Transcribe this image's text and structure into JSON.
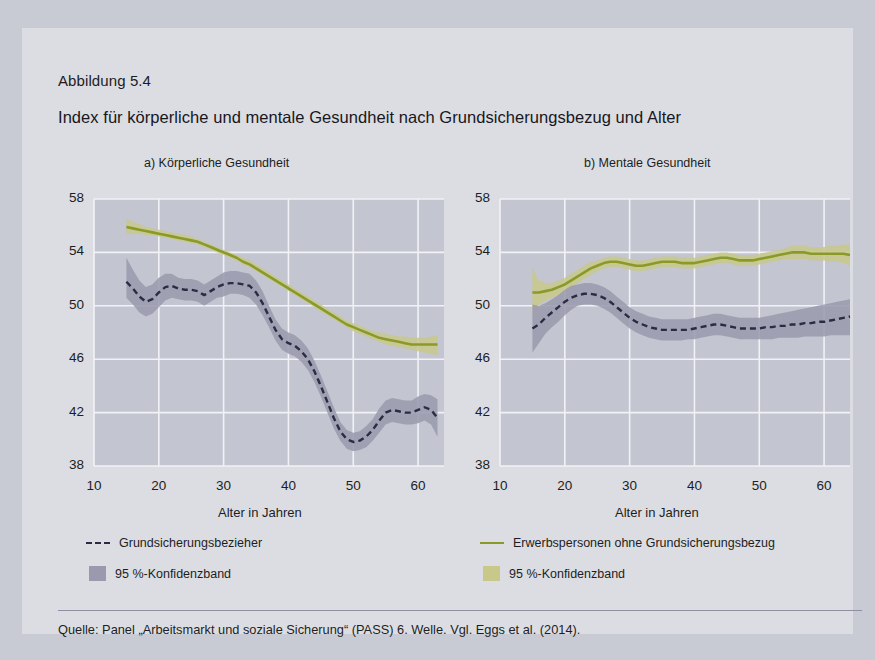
{
  "figure": {
    "label": "Abbildung 5.4",
    "title": "Index für körperliche und mentale Gesundheit nach Grundsicherungsbezug und Alter",
    "source": "Quelle: Panel „Arbeitsmarkt und soziale Sicherung“ (PASS) 6. Welle. Vgl. Eggs et al. (2014)."
  },
  "legend": {
    "items": [
      {
        "label": "Grundsicherungsbezieher",
        "marker": "dashed-line",
        "color": "#2b2b44"
      },
      {
        "label": "Erwerbspersonen ohne Grundsicherungsbezug",
        "marker": "solid-line",
        "color": "#8a9a29"
      },
      {
        "label": "95 %-Konfidenzband",
        "marker": "filled-box",
        "color": "#9a99ae"
      },
      {
        "label": "95 %-Konfidenzband",
        "marker": "filled-box",
        "color": "#c8c88a"
      }
    ]
  },
  "chart_data": [
    {
      "type": "line",
      "panel": "a",
      "title": "a) Körperliche Gesundheit",
      "xlabel": "Alter in Jahren",
      "ylabel": "",
      "xlim": [
        10,
        64
      ],
      "ylim": [
        38,
        58
      ],
      "xticks": [
        10,
        20,
        30,
        40,
        50,
        60
      ],
      "yticks": [
        38,
        42,
        46,
        50,
        54,
        58
      ],
      "grid": true,
      "legend_position": "below-figure",
      "x": [
        15,
        16,
        17,
        18,
        19,
        20,
        21,
        22,
        23,
        24,
        25,
        26,
        27,
        28,
        29,
        30,
        31,
        32,
        33,
        34,
        35,
        36,
        37,
        38,
        39,
        40,
        41,
        42,
        43,
        44,
        45,
        46,
        47,
        48,
        49,
        50,
        51,
        52,
        53,
        54,
        55,
        56,
        57,
        58,
        59,
        60,
        61,
        62,
        63
      ],
      "series": [
        {
          "name": "Grundsicherungsbezieher",
          "style": "dashed",
          "color": "#2b2b44",
          "band_color": "#9a99ae",
          "values": [
            51.8,
            51.3,
            50.7,
            50.3,
            50.5,
            51.0,
            51.4,
            51.5,
            51.3,
            51.2,
            51.2,
            51.1,
            50.8,
            51.1,
            51.4,
            51.6,
            51.7,
            51.7,
            51.6,
            51.5,
            51.0,
            50.2,
            49.2,
            48.2,
            47.5,
            47.2,
            47.0,
            46.6,
            46.0,
            45.1,
            44.0,
            42.8,
            41.6,
            40.6,
            40.0,
            39.8,
            39.9,
            40.2,
            40.7,
            41.4,
            42.0,
            42.2,
            42.1,
            42.0,
            42.0,
            42.2,
            42.4,
            42.2,
            41.6
          ],
          "band_lower": [
            50.6,
            50.1,
            49.5,
            49.2,
            49.4,
            49.9,
            50.4,
            50.6,
            50.5,
            50.4,
            50.4,
            50.3,
            50.0,
            50.3,
            50.6,
            50.7,
            50.9,
            50.9,
            50.8,
            50.6,
            50.1,
            49.3,
            48.4,
            47.4,
            46.7,
            46.4,
            46.2,
            45.8,
            45.2,
            44.3,
            43.2,
            42.0,
            40.8,
            39.9,
            39.3,
            39.1,
            39.2,
            39.4,
            39.9,
            40.5,
            41.1,
            41.3,
            41.2,
            41.1,
            41.1,
            41.2,
            41.4,
            41.1,
            40.2
          ],
          "band_upper": [
            53.6,
            52.7,
            51.9,
            51.4,
            51.6,
            52.1,
            52.4,
            52.4,
            52.1,
            52.0,
            52.0,
            51.9,
            51.6,
            51.9,
            52.2,
            52.5,
            52.6,
            52.6,
            52.5,
            52.4,
            51.9,
            51.1,
            50.0,
            49.0,
            48.3,
            48.0,
            47.8,
            47.4,
            46.8,
            45.9,
            44.8,
            43.6,
            42.4,
            41.3,
            40.7,
            40.5,
            40.6,
            41.0,
            41.5,
            42.3,
            42.9,
            43.1,
            43.0,
            42.9,
            42.9,
            43.2,
            43.4,
            43.3,
            43.0
          ]
        },
        {
          "name": "Erwerbspersonen ohne Grundsicherungsbezug",
          "style": "solid",
          "color": "#8a9a29",
          "band_color": "#c8c88a",
          "values": [
            55.9,
            55.8,
            55.7,
            55.6,
            55.5,
            55.4,
            55.3,
            55.2,
            55.1,
            55.0,
            54.9,
            54.8,
            54.6,
            54.4,
            54.2,
            54.0,
            53.8,
            53.6,
            53.3,
            53.1,
            52.8,
            52.5,
            52.2,
            51.9,
            51.6,
            51.3,
            51.0,
            50.7,
            50.4,
            50.1,
            49.8,
            49.5,
            49.2,
            48.9,
            48.6,
            48.4,
            48.2,
            48.0,
            47.8,
            47.6,
            47.5,
            47.4,
            47.3,
            47.2,
            47.1,
            47.1,
            47.1,
            47.1,
            47.1
          ],
          "band_lower": [
            55.4,
            55.4,
            55.4,
            55.3,
            55.3,
            55.2,
            55.1,
            55.0,
            54.9,
            54.8,
            54.7,
            54.6,
            54.4,
            54.2,
            54.0,
            53.8,
            53.6,
            53.4,
            53.1,
            52.9,
            52.6,
            52.3,
            52.0,
            51.7,
            51.4,
            51.1,
            50.8,
            50.5,
            50.2,
            49.9,
            49.6,
            49.3,
            49.0,
            48.7,
            48.4,
            48.1,
            47.9,
            47.7,
            47.5,
            47.3,
            47.1,
            47.0,
            46.9,
            46.8,
            46.7,
            46.6,
            46.5,
            46.4,
            46.3
          ],
          "band_upper": [
            56.5,
            56.3,
            56.1,
            55.9,
            55.8,
            55.7,
            55.6,
            55.5,
            55.4,
            55.3,
            55.2,
            55.0,
            54.8,
            54.6,
            54.4,
            54.2,
            54.0,
            53.8,
            53.6,
            53.4,
            53.1,
            52.8,
            52.5,
            52.2,
            51.9,
            51.6,
            51.3,
            51.0,
            50.7,
            50.4,
            50.1,
            49.8,
            49.5,
            49.2,
            48.9,
            48.7,
            48.5,
            48.3,
            48.1,
            48.0,
            47.9,
            47.8,
            47.7,
            47.7,
            47.6,
            47.6,
            47.6,
            47.7,
            47.8
          ]
        }
      ]
    },
    {
      "type": "line",
      "panel": "b",
      "title": "b) Mentale Gesundheit",
      "xlabel": "Alter in Jahren",
      "ylabel": "",
      "xlim": [
        10,
        64
      ],
      "ylim": [
        38,
        58
      ],
      "xticks": [
        10,
        20,
        30,
        40,
        50,
        60
      ],
      "yticks": [
        38,
        42,
        46,
        50,
        54,
        58
      ],
      "grid": true,
      "legend_position": "below-figure",
      "x": [
        15,
        16,
        17,
        18,
        19,
        20,
        21,
        22,
        23,
        24,
        25,
        26,
        27,
        28,
        29,
        30,
        31,
        32,
        33,
        34,
        35,
        36,
        37,
        38,
        39,
        40,
        41,
        42,
        43,
        44,
        45,
        46,
        47,
        48,
        49,
        50,
        51,
        52,
        53,
        54,
        55,
        56,
        57,
        58,
        59,
        60,
        61,
        62,
        63,
        64
      ],
      "series": [
        {
          "name": "Grundsicherungsbezieher",
          "style": "dashed",
          "color": "#2b2b44",
          "band_color": "#9a99ae",
          "values": [
            48.3,
            48.6,
            49.1,
            49.5,
            49.9,
            50.3,
            50.6,
            50.8,
            50.9,
            50.9,
            50.8,
            50.6,
            50.3,
            49.9,
            49.5,
            49.1,
            48.8,
            48.6,
            48.4,
            48.3,
            48.2,
            48.2,
            48.2,
            48.2,
            48.2,
            48.3,
            48.4,
            48.5,
            48.6,
            48.6,
            48.5,
            48.4,
            48.3,
            48.3,
            48.3,
            48.3,
            48.4,
            48.4,
            48.5,
            48.5,
            48.6,
            48.6,
            48.7,
            48.7,
            48.8,
            48.8,
            48.9,
            49.0,
            49.1,
            49.2
          ],
          "band_lower": [
            46.5,
            47.2,
            47.9,
            48.4,
            48.8,
            49.3,
            49.7,
            50.0,
            50.1,
            50.1,
            50.0,
            49.8,
            49.5,
            49.1,
            48.7,
            48.3,
            48.0,
            47.8,
            47.6,
            47.5,
            47.4,
            47.4,
            47.4,
            47.4,
            47.5,
            47.5,
            47.6,
            47.7,
            47.8,
            47.8,
            47.7,
            47.6,
            47.5,
            47.5,
            47.5,
            47.5,
            47.5,
            47.5,
            47.6,
            47.6,
            47.6,
            47.6,
            47.7,
            47.7,
            47.7,
            47.7,
            47.8,
            47.8,
            47.8,
            47.8
          ],
          "band_upper": [
            50.1,
            50.0,
            50.2,
            50.5,
            50.8,
            51.2,
            51.5,
            51.6,
            51.7,
            51.7,
            51.6,
            51.4,
            51.1,
            50.7,
            50.3,
            49.9,
            49.6,
            49.4,
            49.2,
            49.1,
            49.0,
            49.0,
            49.0,
            49.0,
            49.0,
            49.1,
            49.2,
            49.3,
            49.4,
            49.4,
            49.3,
            49.2,
            49.1,
            49.1,
            49.1,
            49.1,
            49.2,
            49.3,
            49.4,
            49.5,
            49.6,
            49.7,
            49.8,
            49.9,
            50.0,
            50.1,
            50.2,
            50.3,
            50.4,
            50.5
          ]
        },
        {
          "name": "Erwerbspersonen ohne Grundsicherungsbezug",
          "style": "solid",
          "color": "#8a9a29",
          "band_color": "#c8c88a",
          "values": [
            51.0,
            51.0,
            51.1,
            51.2,
            51.4,
            51.6,
            51.9,
            52.2,
            52.5,
            52.8,
            53.0,
            53.2,
            53.3,
            53.3,
            53.2,
            53.1,
            53.0,
            53.0,
            53.1,
            53.2,
            53.3,
            53.3,
            53.3,
            53.2,
            53.2,
            53.2,
            53.3,
            53.4,
            53.5,
            53.6,
            53.6,
            53.5,
            53.4,
            53.4,
            53.4,
            53.5,
            53.6,
            53.7,
            53.8,
            53.9,
            54.0,
            54.0,
            54.0,
            53.9,
            53.9,
            53.9,
            53.9,
            53.9,
            53.9,
            53.8
          ],
          "band_lower": [
            49.2,
            50.1,
            50.4,
            50.6,
            50.8,
            51.1,
            51.4,
            51.7,
            52.0,
            52.3,
            52.6,
            52.8,
            52.9,
            52.9,
            52.8,
            52.7,
            52.6,
            52.6,
            52.7,
            52.8,
            52.9,
            52.9,
            52.9,
            52.8,
            52.8,
            52.8,
            52.9,
            53.0,
            53.1,
            53.2,
            53.2,
            53.1,
            53.0,
            53.0,
            53.0,
            53.1,
            53.2,
            53.3,
            53.4,
            53.5,
            53.5,
            53.5,
            53.5,
            53.4,
            53.4,
            53.4,
            53.3,
            53.3,
            53.2,
            53.0
          ],
          "band_upper": [
            52.8,
            51.9,
            51.7,
            51.7,
            51.9,
            52.1,
            52.4,
            52.7,
            53.0,
            53.3,
            53.4,
            53.6,
            53.7,
            53.7,
            53.6,
            53.5,
            53.4,
            53.4,
            53.5,
            53.6,
            53.7,
            53.7,
            53.7,
            53.6,
            53.6,
            53.6,
            53.7,
            53.8,
            53.9,
            54.0,
            54.0,
            53.9,
            53.8,
            53.8,
            53.8,
            53.9,
            54.0,
            54.1,
            54.2,
            54.3,
            54.5,
            54.5,
            54.5,
            54.4,
            54.4,
            54.4,
            54.5,
            54.5,
            54.6,
            54.6
          ]
        }
      ]
    }
  ]
}
